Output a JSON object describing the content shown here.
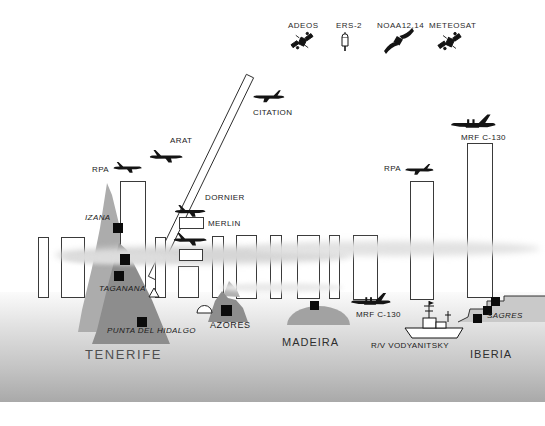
{
  "diagram": {
    "satellites": [
      {
        "label": "ADEOS"
      },
      {
        "label": "ERS-2"
      },
      {
        "label": "NOAA12,14"
      },
      {
        "label": "METEOSAT"
      }
    ],
    "aircraft": {
      "citation": "CITATION",
      "arat": "ARAT",
      "dornier": "DORNIER",
      "merlin": "MERLIN",
      "rpa_left": "RPA",
      "rpa_right": "RPA",
      "c130_top": "MRF C-130",
      "c130_low": "MRF C-130"
    },
    "ships": {
      "vodyanitsky": "R/V VODYANITSKY",
      "sagres": "SAGRES"
    },
    "stations": {
      "izana": "IZANA",
      "taganana": "TAGANANA",
      "punta": "PUNTA DEL HIDALGO"
    },
    "places": {
      "tenerife": "TENERIFE",
      "azores": "AZORES",
      "madeira": "MADEIRA",
      "iberia": "IBERIA"
    },
    "colors": {
      "ink": "#111111",
      "mountain": "#acacac",
      "mountain_dark": "#8d8d8d",
      "island": "#8d8d8d",
      "madeira_island": "#a2a2a2",
      "iberia_coast": "#c9c9c9",
      "cloud": "#d6d6d6",
      "sea_deep": "#a9a9a9",
      "marker": "#0b0b0b"
    }
  }
}
